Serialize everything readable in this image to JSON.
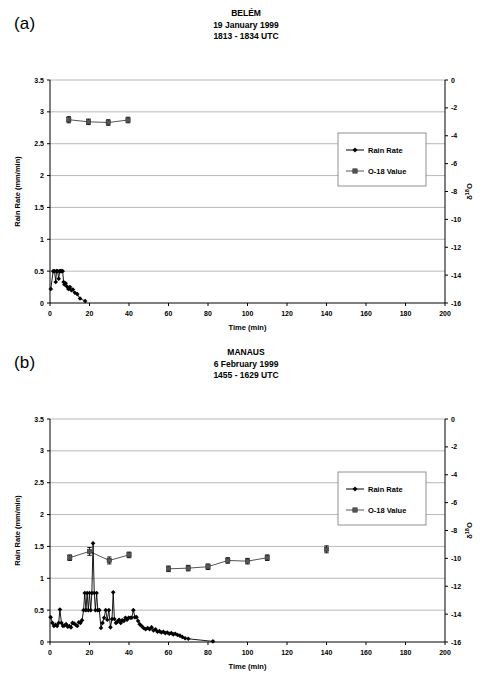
{
  "figure": {
    "panel_a_label": "(a)",
    "panel_b_label": "(b)"
  },
  "chart_data": [
    {
      "type": "line",
      "panel": "(a)",
      "title": "BELÉM",
      "subtitle_date": "19 January 1999",
      "subtitle_time": "1813 - 1834 UTC",
      "xlabel": "Time (min)",
      "ylabel": "Rain Rate (mm/min)",
      "y2label": "δ 18O",
      "xlim": [
        0,
        200
      ],
      "ylim": [
        0,
        3.5
      ],
      "y2lim": [
        -16,
        0
      ],
      "xticks": [
        0,
        20,
        40,
        60,
        80,
        100,
        120,
        140,
        160,
        180,
        200
      ],
      "yticks": [
        0,
        0.5,
        1,
        1.5,
        2,
        2.5,
        3,
        3.5
      ],
      "y2ticks": [
        0,
        -2,
        -4,
        -6,
        -8,
        -10,
        -12,
        -14,
        -16
      ],
      "grid": "horizontal",
      "legend_position": "center-right",
      "series": [
        {
          "name": "Rain Rate",
          "marker": "diamond",
          "color": "#000000",
          "axis": "left",
          "points": [
            {
              "x": 0.4,
              "y": 0.22
            },
            {
              "x": 1.6,
              "y": 0.5
            },
            {
              "x": 2.3,
              "y": 0.5
            },
            {
              "x": 2.9,
              "y": 0.33
            },
            {
              "x": 3.3,
              "y": 0.5
            },
            {
              "x": 3.9,
              "y": 0.5
            },
            {
              "x": 4.4,
              "y": 0.38
            },
            {
              "x": 4.9,
              "y": 0.5
            },
            {
              "x": 5.4,
              "y": 0.5
            },
            {
              "x": 5.9,
              "y": 0.5
            },
            {
              "x": 6.4,
              "y": 0.5
            },
            {
              "x": 6.9,
              "y": 0.33
            },
            {
              "x": 7.3,
              "y": 0.29
            },
            {
              "x": 7.9,
              "y": 0.31
            },
            {
              "x": 8.6,
              "y": 0.26
            },
            {
              "x": 9.3,
              "y": 0.22
            },
            {
              "x": 10.1,
              "y": 0.25
            },
            {
              "x": 10.8,
              "y": 0.2
            },
            {
              "x": 11.6,
              "y": 0.21
            },
            {
              "x": 12.6,
              "y": 0.16
            },
            {
              "x": 13.8,
              "y": 0.14
            },
            {
              "x": 15.2,
              "y": 0.07
            },
            {
              "x": 17.8,
              "y": 0.03
            }
          ]
        },
        {
          "name": "O-18 Value",
          "marker": "square",
          "color": "#555555",
          "axis": "right",
          "points": [
            {
              "x": 9.5,
              "y": -2.85,
              "err": 0.22
            },
            {
              "x": 19.5,
              "y": -3.0,
              "err": 0.2
            },
            {
              "x": 29.5,
              "y": -3.05,
              "err": 0.2
            },
            {
              "x": 39.5,
              "y": -2.87,
              "err": 0.2
            }
          ]
        }
      ]
    },
    {
      "type": "line",
      "panel": "(b)",
      "title": "MANAUS",
      "subtitle_date": "6 February 1999",
      "subtitle_time": "1455 - 1629 UTC",
      "xlabel": "Time (min)",
      "ylabel": "Rain Rate (mm/min)",
      "y2label": "δ 18O",
      "xlim": [
        0,
        200
      ],
      "ylim": [
        0,
        3.5
      ],
      "y2lim": [
        -16,
        0
      ],
      "xticks": [
        0,
        20,
        40,
        60,
        80,
        100,
        120,
        140,
        160,
        180,
        200
      ],
      "yticks": [
        0,
        0.5,
        1,
        1.5,
        2,
        2.5,
        3,
        3.5
      ],
      "y2ticks": [
        0,
        -2,
        -4,
        -6,
        -8,
        -10,
        -12,
        -14,
        -16
      ],
      "grid": "horizontal",
      "legend_position": "center-right",
      "series": [
        {
          "name": "Rain Rate",
          "marker": "diamond",
          "color": "#000000",
          "axis": "left",
          "points": [
            {
              "x": 0.3,
              "y": 0.39
            },
            {
              "x": 1.2,
              "y": 0.3
            },
            {
              "x": 2.0,
              "y": 0.25
            },
            {
              "x": 2.8,
              "y": 0.27
            },
            {
              "x": 3.6,
              "y": 0.25
            },
            {
              "x": 4.4,
              "y": 0.3
            },
            {
              "x": 5.0,
              "y": 0.51
            },
            {
              "x": 5.8,
              "y": 0.3
            },
            {
              "x": 6.6,
              "y": 0.25
            },
            {
              "x": 7.4,
              "y": 0.26
            },
            {
              "x": 8.2,
              "y": 0.28
            },
            {
              "x": 9.0,
              "y": 0.24
            },
            {
              "x": 9.8,
              "y": 0.25
            },
            {
              "x": 10.6,
              "y": 0.23
            },
            {
              "x": 11.4,
              "y": 0.3
            },
            {
              "x": 12.2,
              "y": 0.29
            },
            {
              "x": 13.0,
              "y": 0.27
            },
            {
              "x": 13.8,
              "y": 0.25
            },
            {
              "x": 14.6,
              "y": 0.31
            },
            {
              "x": 15.4,
              "y": 0.3
            },
            {
              "x": 16.2,
              "y": 0.34
            },
            {
              "x": 17.0,
              "y": 0.5
            },
            {
              "x": 17.6,
              "y": 0.77
            },
            {
              "x": 18.2,
              "y": 0.5
            },
            {
              "x": 18.8,
              "y": 0.77
            },
            {
              "x": 19.4,
              "y": 0.5
            },
            {
              "x": 20.0,
              "y": 0.77
            },
            {
              "x": 20.6,
              "y": 0.5
            },
            {
              "x": 21.2,
              "y": 0.77
            },
            {
              "x": 21.8,
              "y": 1.55
            },
            {
              "x": 22.4,
              "y": 0.77
            },
            {
              "x": 23.0,
              "y": 0.5
            },
            {
              "x": 23.6,
              "y": 0.77
            },
            {
              "x": 24.2,
              "y": 0.5
            },
            {
              "x": 25.0,
              "y": 0.5
            },
            {
              "x": 25.8,
              "y": 0.22
            },
            {
              "x": 26.6,
              "y": 0.3
            },
            {
              "x": 27.4,
              "y": 0.38
            },
            {
              "x": 28.2,
              "y": 0.5
            },
            {
              "x": 29.0,
              "y": 0.35
            },
            {
              "x": 29.8,
              "y": 0.5
            },
            {
              "x": 30.6,
              "y": 0.23
            },
            {
              "x": 31.4,
              "y": 0.36
            },
            {
              "x": 32.0,
              "y": 0.78
            },
            {
              "x": 32.6,
              "y": 0.36
            },
            {
              "x": 33.4,
              "y": 0.3
            },
            {
              "x": 34.2,
              "y": 0.32
            },
            {
              "x": 35.0,
              "y": 0.35
            },
            {
              "x": 35.8,
              "y": 0.3
            },
            {
              "x": 36.6,
              "y": 0.34
            },
            {
              "x": 37.4,
              "y": 0.33
            },
            {
              "x": 38.2,
              "y": 0.38
            },
            {
              "x": 39.0,
              "y": 0.35
            },
            {
              "x": 39.8,
              "y": 0.38
            },
            {
              "x": 40.6,
              "y": 0.38
            },
            {
              "x": 41.4,
              "y": 0.38
            },
            {
              "x": 42.2,
              "y": 0.5
            },
            {
              "x": 43.0,
              "y": 0.39
            },
            {
              "x": 43.8,
              "y": 0.39
            },
            {
              "x": 44.6,
              "y": 0.33
            },
            {
              "x": 45.4,
              "y": 0.28
            },
            {
              "x": 46.4,
              "y": 0.25
            },
            {
              "x": 47.4,
              "y": 0.22
            },
            {
              "x": 48.4,
              "y": 0.2
            },
            {
              "x": 49.4,
              "y": 0.22
            },
            {
              "x": 50.4,
              "y": 0.2
            },
            {
              "x": 51.4,
              "y": 0.23
            },
            {
              "x": 52.4,
              "y": 0.18
            },
            {
              "x": 53.4,
              "y": 0.2
            },
            {
              "x": 54.4,
              "y": 0.16
            },
            {
              "x": 55.4,
              "y": 0.17
            },
            {
              "x": 56.4,
              "y": 0.15
            },
            {
              "x": 57.4,
              "y": 0.16
            },
            {
              "x": 58.4,
              "y": 0.14
            },
            {
              "x": 59.4,
              "y": 0.15
            },
            {
              "x": 60.4,
              "y": 0.13
            },
            {
              "x": 61.4,
              "y": 0.14
            },
            {
              "x": 62.4,
              "y": 0.12
            },
            {
              "x": 63.4,
              "y": 0.13
            },
            {
              "x": 64.6,
              "y": 0.11
            },
            {
              "x": 65.8,
              "y": 0.1
            },
            {
              "x": 67.0,
              "y": 0.08
            },
            {
              "x": 68.4,
              "y": 0.06
            },
            {
              "x": 70.0,
              "y": 0.05
            },
            {
              "x": 82.5,
              "y": 0.01
            }
          ]
        },
        {
          "name": "O-18 Value",
          "marker": "square",
          "color": "#555555",
          "axis": "right",
          "points": [
            {
              "x": 10.0,
              "y": -9.95,
              "err": 0.2
            },
            {
              "x": 20.0,
              "y": -9.5,
              "err": 0.28
            },
            {
              "x": 30.0,
              "y": -10.15,
              "err": 0.25
            },
            {
              "x": 40.0,
              "y": -9.75,
              "err": 0.2
            },
            {
              "x": 60.0,
              "y": -10.75,
              "err": 0.2
            },
            {
              "x": 70.0,
              "y": -10.7,
              "err": 0.2
            },
            {
              "x": 80.0,
              "y": -10.6,
              "err": 0.2
            },
            {
              "x": 90.0,
              "y": -10.15,
              "err": 0.2
            },
            {
              "x": 100.0,
              "y": -10.2,
              "err": 0.2
            },
            {
              "x": 110.0,
              "y": -9.95,
              "err": 0.2
            },
            {
              "x": 140.0,
              "y": -9.35,
              "err": 0.25
            }
          ]
        }
      ]
    }
  ]
}
